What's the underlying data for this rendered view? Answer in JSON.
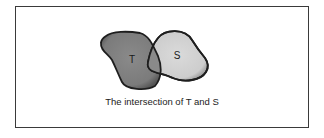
{
  "diagram": {
    "sets": [
      {
        "label": "T",
        "fill": "#7f7f7f",
        "stroke": "#1e1e1e"
      },
      {
        "label": "S",
        "fill": "#d3d3d3",
        "stroke": "#1e1e1e"
      }
    ],
    "intersection_fill": "#8a8a8a",
    "caption": "The intersection of T and S"
  }
}
